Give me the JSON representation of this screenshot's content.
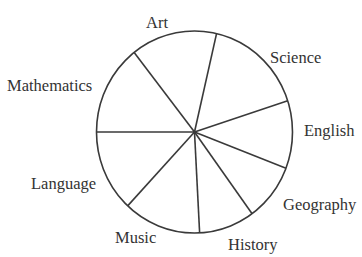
{
  "chart_data": {
    "type": "pie",
    "title": "",
    "unit": "degrees",
    "start_boundary": "Lang/Math boundary at 9 o'clock, slices proceed clockwise",
    "categories": [
      "Mathematics",
      "Art",
      "Science",
      "English",
      "Geography",
      "History",
      "Music",
      "Language"
    ],
    "values": [
      52,
      51,
      59,
      39,
      33,
      33,
      46,
      47
    ],
    "percent_estimates": [
      14.5,
      14.2,
      16.4,
      10.8,
      9.2,
      9.2,
      12.8,
      13.1
    ],
    "direction": "clockwise",
    "labels_outside": true,
    "legend": "none",
    "colors": {
      "fill": "#ffffff",
      "stroke": "#3a3a3a",
      "text": "#333333",
      "background": "#ffffff"
    }
  }
}
